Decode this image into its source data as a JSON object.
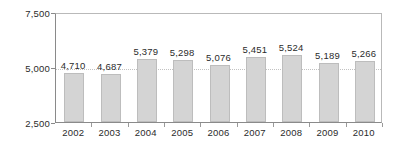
{
  "chart_data": {
    "type": "bar",
    "title": "",
    "subtitle": "",
    "xlabel": "",
    "ylabel": "",
    "categories": [
      "2002",
      "2003",
      "2004",
      "2005",
      "2006",
      "2007",
      "2008",
      "2009",
      "2010"
    ],
    "values": [
      4710,
      4687,
      5379,
      5298,
      5076,
      5451,
      5524,
      5189,
      5266
    ],
    "value_labels": [
      "4,710",
      "4,687",
      "5,379",
      "5,298",
      "5,076",
      "5,451",
      "5,524",
      "5,189",
      "5,266"
    ],
    "ylim": [
      2500,
      7500
    ],
    "ytick_values": [
      7500,
      5000,
      2500
    ],
    "ytick_labels": [
      "7,500",
      "5,000",
      "2,500"
    ],
    "grid": true,
    "gridlines_at": [
      5000
    ],
    "legend": null,
    "legend_position": "none",
    "series": [
      {
        "name": "",
        "values": [
          4710,
          4687,
          5379,
          5298,
          5076,
          5451,
          5524,
          5189,
          5266
        ]
      }
    ],
    "colors": {
      "bar_fill": "#d4d4d4",
      "bar_border": "#bdbdbd",
      "axis": "#8a8a8a",
      "frame": "#b9b9b9",
      "gridline": "#c2c2c2",
      "text": "#2b2b2b",
      "background": "#ffffff"
    }
  }
}
